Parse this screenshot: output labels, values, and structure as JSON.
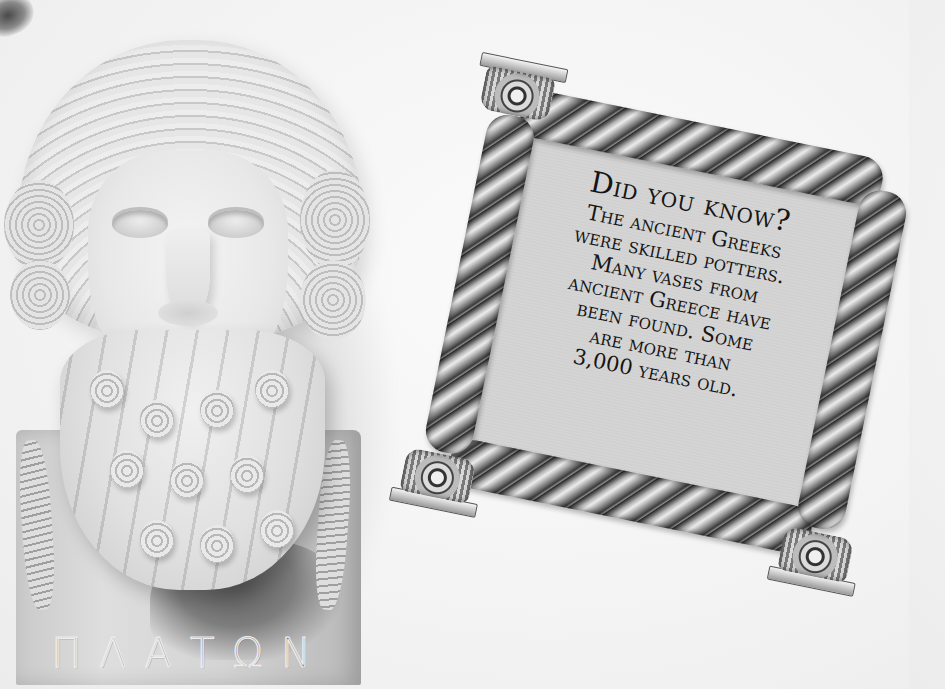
{
  "illustration": {
    "bust": {
      "subject": "Plato marble herm bust",
      "inscription": "ΠΛΑΤΩΝ"
    },
    "fact_box": {
      "title": "Did you know?",
      "body_lines": [
        "The ancient Greeks",
        "were skilled potters.",
        "Many vases from",
        "ancient Greece have",
        "been found. Some",
        "are more than",
        "3,000 years old."
      ]
    }
  },
  "colors": {
    "background": "#f3f3f3",
    "panel": "#d4d4d4",
    "text": "#151515",
    "rope_dark": "#2a2a2a",
    "rope_light": "#ececec"
  }
}
